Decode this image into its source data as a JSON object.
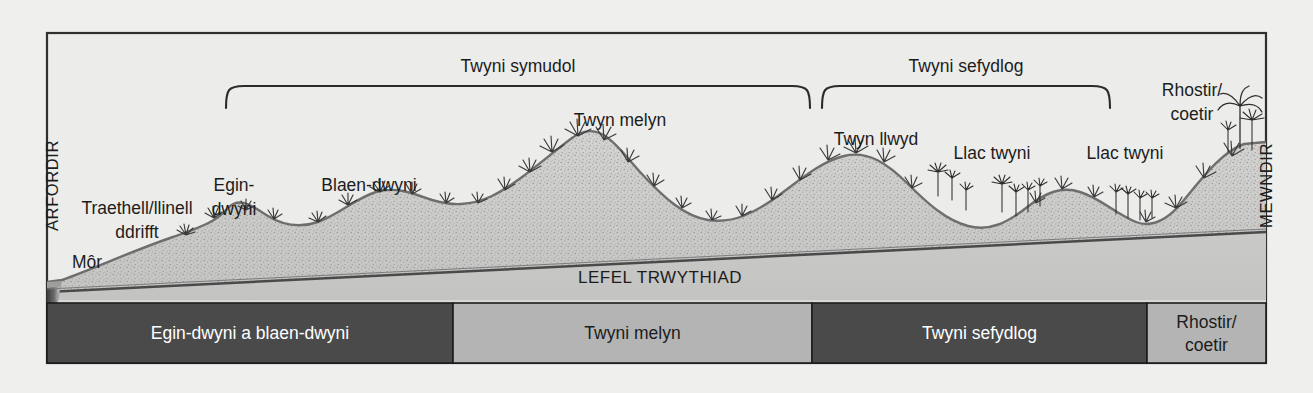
{
  "diagram": {
    "title_axis_left": "ARFORDIR",
    "title_axis_right": "MEWNDIR",
    "water_table_label": "LEFEL TRWYTHIAD",
    "sea_label": "Môr"
  },
  "brackets": [
    {
      "label": "Twyni symudol",
      "x1": 226,
      "x2": 810,
      "y": 85,
      "text_x": 518,
      "text_y": 70
    },
    {
      "label": "Twyni sefydlog",
      "x1": 822,
      "x2": 1110,
      "y": 85,
      "text_x": 966,
      "text_y": 70
    }
  ],
  "feature_labels": [
    {
      "name": "beach-strandline",
      "lines": [
        "Traethell/llinell",
        "ddrifft"
      ],
      "x": 137,
      "y": 212
    },
    {
      "name": "embryo-dunes",
      "lines": [
        "Egin-",
        "dwyni"
      ],
      "x": 234,
      "y": 189
    },
    {
      "name": "fore-dunes",
      "lines": [
        "Blaen-dwyni"
      ],
      "x": 369,
      "y": 189
    },
    {
      "name": "yellow-dune",
      "lines": [
        "Twyn melyn"
      ],
      "x": 620,
      "y": 124
    },
    {
      "name": "grey-dune",
      "lines": [
        "Twyn llwyd"
      ],
      "x": 876,
      "y": 143
    },
    {
      "name": "dune-slack-1",
      "lines": [
        "Llac twyni"
      ],
      "x": 992,
      "y": 157
    },
    {
      "name": "dune-slack-2",
      "lines": [
        "Llac twyni"
      ],
      "x": 1125,
      "y": 157
    },
    {
      "name": "heath-woodland",
      "lines": [
        "Rhostir/",
        "coetir"
      ],
      "x": 1192,
      "y": 94
    }
  ],
  "zone_bar": {
    "y": 303,
    "height": 60,
    "zones": [
      {
        "label": "Egin-dwyni a blaen-dwyni",
        "x1": 47,
        "x2": 453,
        "fill": "#4a4a4a",
        "text": "#ffffff"
      },
      {
        "label": "Twyni melyn",
        "x1": 453,
        "x2": 812,
        "fill": "#b4b4b4",
        "text": "#1c1c1c"
      },
      {
        "label": "Twyni sefydlog",
        "x1": 812,
        "x2": 1147,
        "fill": "#4a4a4a",
        "text": "#ffffff"
      },
      {
        "label": "Rhostir/\ncoetir",
        "x1": 1147,
        "x2": 1266,
        "fill": "#b4b4b4",
        "text": "#1c1c1c"
      }
    ]
  },
  "colors": {
    "page_background": "#efefed",
    "panel_background": "#ececeb",
    "frame_stroke": "#303030",
    "sand_fill": "#cccccb",
    "sand_stroke": "#6e6e6e",
    "substrate_fill": "#d6d6d5",
    "sea_dark": "#4d4d4d",
    "zone_dark": "#4a4a4a",
    "zone_light": "#b4b4b4"
  },
  "chart_data": {
    "type": "area",
    "xlabel": "ARFORDIR → MEWNDIR",
    "ylabel": "",
    "profile_note": "Sand-dune cross-section: height of dune crests rising inland above a gently rising water table.",
    "crest_peaks": [
      {
        "name": "Egin-dwyni",
        "x": 230,
        "height_rank": 1
      },
      {
        "name": "Blaen-dwyni",
        "x": 390,
        "height_rank": 2
      },
      {
        "name": "Twyn melyn",
        "x": 620,
        "height_rank": 5
      },
      {
        "name": "Twyn llwyd",
        "x": 875,
        "height_rank": 4
      },
      {
        "name": "Llac twyni",
        "x": 1060,
        "height_rank": 2
      },
      {
        "name": "Rhostir/coetir",
        "x": 1235,
        "height_rank": 5
      }
    ]
  }
}
